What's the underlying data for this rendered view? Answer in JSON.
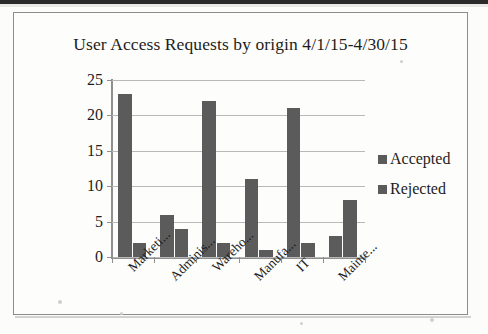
{
  "document": {
    "kind": "scanned-page",
    "border_color": "#8d8d8d",
    "background_color": "#fdfdfc"
  },
  "chart_data": {
    "type": "bar",
    "title": "User Access Requests by origin 4/1/15-4/30/15",
    "xlabel": "",
    "ylabel": "",
    "ylim": [
      0,
      25
    ],
    "yticks": [
      0,
      5,
      10,
      15,
      20,
      25
    ],
    "grid": true,
    "legend_position": "right",
    "bar_color": "#5b5b5b",
    "categories": [
      "Marketi...",
      "Adminis...",
      "Wareho...",
      "Manufa...",
      "IT",
      "Mainte..."
    ],
    "series": [
      {
        "name": "Accepted",
        "values": [
          23,
          6,
          22,
          11,
          21,
          3
        ],
        "color": "#5b5b5b"
      },
      {
        "name": "Rejected",
        "values": [
          2,
          4,
          2,
          1,
          2,
          8
        ],
        "color": "#5b5b5b"
      }
    ]
  }
}
